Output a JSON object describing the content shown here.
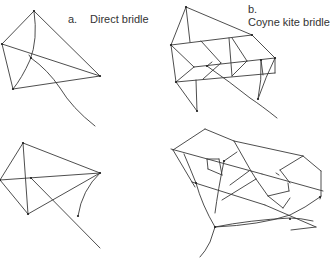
{
  "labels": {
    "a": {
      "letter": "a.",
      "title": "Direct bridle"
    },
    "b": {
      "letter": "b.",
      "title": "Coyne kite bridle"
    }
  },
  "colors": {
    "line": "#3a3a3a",
    "background": "#ffffff"
  },
  "panels": {
    "a_top": {
      "lines": [
        "M34,11 L2,44",
        "M34,11 L100,76",
        "M2,44 L13,89",
        "M13,89 L100,76",
        "M2,44 L100,76",
        "M34,11 Q38,40 30,60 Q22,78 13,89",
        "M31,58 L29,55 M31,58 Q48,70 60,88 Q72,108 95,126"
      ],
      "dots": [
        [
          34,
          11
        ],
        [
          2,
          44
        ],
        [
          100,
          76
        ],
        [
          13,
          89
        ],
        [
          31,
          58
        ]
      ]
    },
    "b_top": {
      "lines": [
        "M186,7 L171,45",
        "M186,7 L252,35",
        "M186,7 L190,42",
        "M171,45 L252,35",
        "M252,35 L275,58",
        "M171,45 L176,82",
        "M176,82 L197,111",
        "M197,111 L196,80",
        "M171,45 L194,67",
        "M194,67 L275,58",
        "M176,82 L275,73",
        "M176,82 L194,67",
        "M275,58 L275,73",
        "M201,41 L221,63",
        "M221,63 L203,79",
        "M229,38 L232,76",
        "M232,38 L247,61",
        "M247,61 L232,76",
        "M261,60 L263,75",
        "M207,66 L212,62 M207,66 Q230,82 250,98 Q262,106 277,118",
        "M261,60 Q262,80 258,99",
        "M275,58 Q266,76 258,99"
      ],
      "dots": [
        [
          186,
          7
        ],
        [
          252,
          35
        ],
        [
          275,
          58
        ],
        [
          171,
          45
        ],
        [
          176,
          82
        ],
        [
          197,
          111
        ],
        [
          207,
          66
        ],
        [
          258,
          99
        ],
        [
          261,
          60
        ]
      ]
    },
    "c_bottom": {
      "lines": [
        "M23,143 L0,180",
        "M23,143 L100,173",
        "M0,180 L28,214",
        "M28,214 L100,173",
        "M0,180 L100,173",
        "M23,143 L28,214",
        "M31,178 L100,248",
        "M100,173 Q82,190 78,216"
      ],
      "dots": [
        [
          23,
          143
        ],
        [
          0,
          180
        ],
        [
          100,
          173
        ],
        [
          28,
          214
        ],
        [
          31,
          178
        ],
        [
          78,
          216
        ]
      ]
    },
    "d_bottom": {
      "lines": [
        "M205,129 L173,150",
        "M205,129 L234,141",
        "M234,141 L303,156",
        "M303,156 L321,171",
        "M321,171 L321,196",
        "M321,196 L320,199",
        "M171,149 L262,174",
        "M262,174 L323,191",
        "M173,150 L192,182",
        "M192,182 L195,187",
        "M192,182 L265,205",
        "M265,205 L316,227",
        "M316,227 L291,230",
        "M234,141 L251,171",
        "M251,171 L256,179",
        "M207,159 L219,159",
        "M219,159 L222,175",
        "M207,159 L208,169",
        "M222,175 L208,169",
        "M256,179 L222,200",
        "M256,179 L268,196",
        "M268,196 L283,208",
        "M268,196 L289,191",
        "M289,191 L288,183",
        "M303,156 L280,170",
        "M280,170 L290,183",
        "M283,208 L290,198",
        "M249,171 L230,185",
        "M276,173 L279,175",
        "M224,161 Q218,190 215,213",
        "M196,183 Q202,205 215,227",
        "M215,227 L210,242 Q205,252 200,257",
        "M215,227 Q260,225 290,215 Q305,208 320,197",
        "M215,227 Q250,220 290,218 Q300,218 313,221",
        "M196,183 Q190,168 184,154",
        "M224,161 L237,152"
      ],
      "dots": [
        [
          224,
          161
        ],
        [
          196,
          183
        ],
        [
          320,
          197
        ],
        [
          215,
          227
        ],
        [
          290,
          219
        ]
      ]
    }
  }
}
